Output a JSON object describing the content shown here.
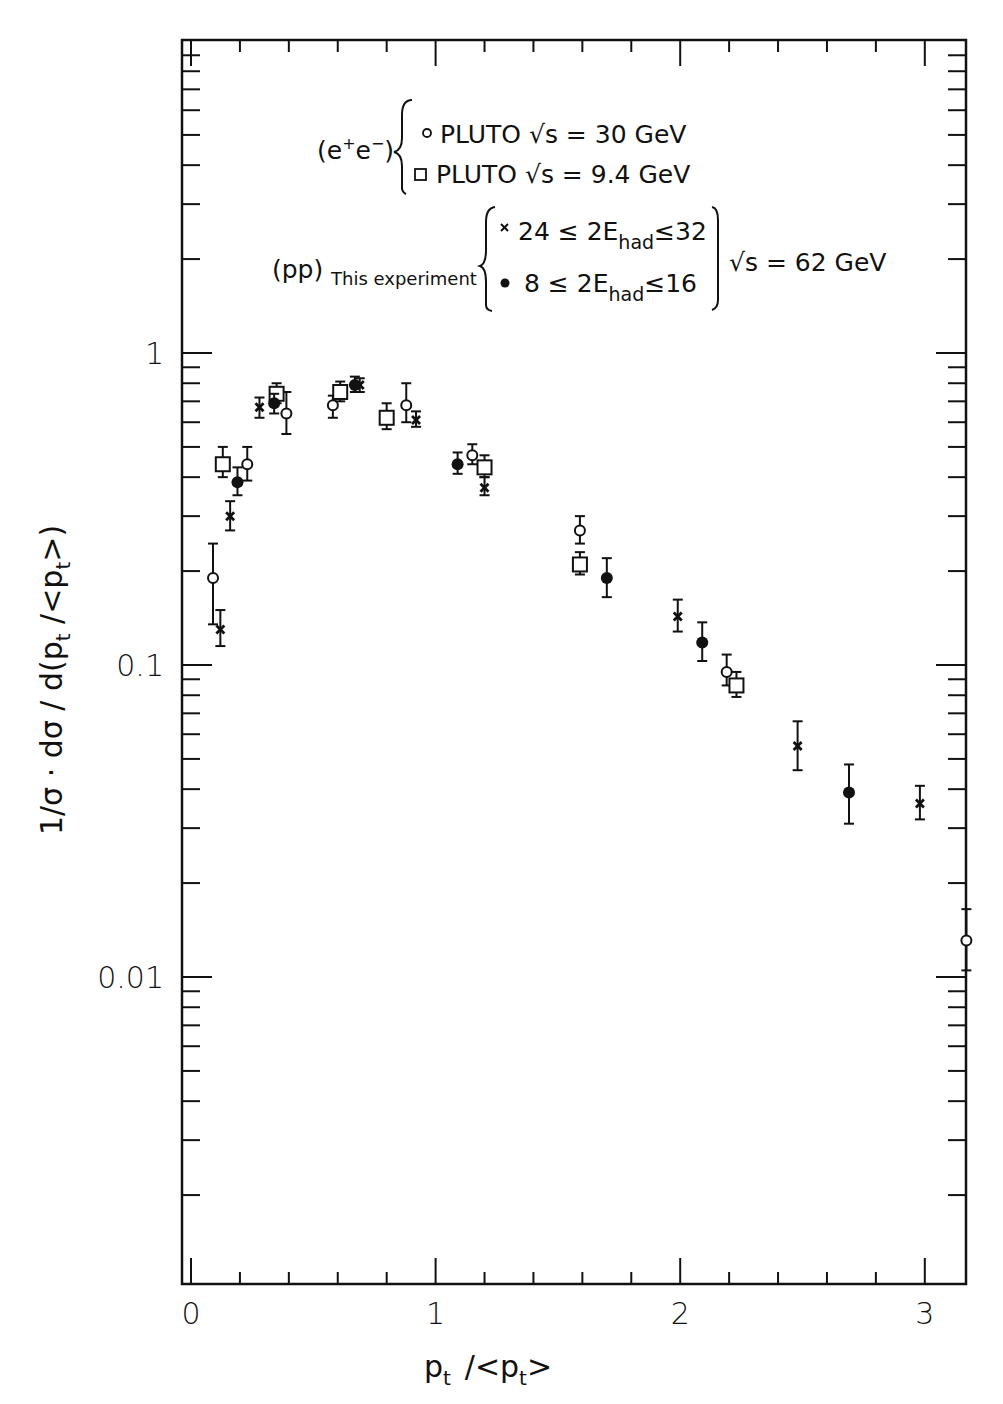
{
  "chart_data": {
    "type": "scatter",
    "title": "",
    "xlabel": "p_t /<p_t>",
    "ylabel": "1/σ · dσ / d(p_t /<p_t>)",
    "xscale": "linear",
    "yscale": "log",
    "xlim": [
      0,
      3.25
    ],
    "ylim": [
      0.001,
      10
    ],
    "x_ticks": [
      0,
      1,
      2,
      3
    ],
    "x_tick_labels": [
      "0",
      "1",
      "2",
      "3"
    ],
    "x_minor_step": 0.2,
    "y_ticks": [
      0.01,
      0.1,
      1
    ],
    "y_tick_labels": [
      "0.01",
      "0.1",
      "1"
    ],
    "grid": false,
    "legend_position": "top-center inside plot",
    "legend": {
      "groups": [
        {
          "label": "(e⁺e⁻)",
          "entries": [
            {
              "marker": "open-circle",
              "text": "PLUTO √s = 30 GeV"
            },
            {
              "marker": "open-square",
              "text": "PLUTO √s = 9.4 GeV"
            }
          ]
        },
        {
          "label": "(pp)",
          "label_sub": "This experiment",
          "entries": [
            {
              "marker": "cross",
              "text": "24 ≤ 2E",
              "sub": "had",
              "tail": "≤32"
            },
            {
              "marker": "filled-circle",
              "text": "8 ≤ 2E",
              "sub": "had",
              "tail": "≤16"
            }
          ],
          "common_note": "√s = 62 GeV"
        }
      ]
    },
    "series": [
      {
        "name": "PLUTO √s = 30 GeV (e+e-)",
        "marker": "open-circle",
        "points": [
          {
            "x": 0.09,
            "y": 0.19,
            "lo": 0.135,
            "hi": 0.245
          },
          {
            "x": 0.23,
            "y": 0.44,
            "lo": 0.39,
            "hi": 0.5
          },
          {
            "x": 0.39,
            "y": 0.64,
            "lo": 0.55,
            "hi": 0.75
          },
          {
            "x": 0.58,
            "y": 0.68,
            "lo": 0.62,
            "hi": 0.73
          },
          {
            "x": 0.88,
            "y": 0.68,
            "lo": 0.6,
            "hi": 0.8
          },
          {
            "x": 1.15,
            "y": 0.47,
            "lo": 0.44,
            "hi": 0.51
          },
          {
            "x": 1.59,
            "y": 0.27,
            "lo": 0.245,
            "hi": 0.3
          },
          {
            "x": 2.19,
            "y": 0.095,
            "lo": 0.086,
            "hi": 0.108
          },
          {
            "x": 3.17,
            "y": 0.0131,
            "lo": 0.0105,
            "hi": 0.0165
          }
        ]
      },
      {
        "name": "PLUTO √s = 9.4 GeV (e+e-)",
        "marker": "open-square",
        "points": [
          {
            "x": 0.13,
            "y": 0.44,
            "lo": 0.4,
            "hi": 0.5
          },
          {
            "x": 0.35,
            "y": 0.74,
            "lo": 0.69,
            "hi": 0.8
          },
          {
            "x": 0.61,
            "y": 0.75,
            "lo": 0.7,
            "hi": 0.81
          },
          {
            "x": 0.8,
            "y": 0.62,
            "lo": 0.57,
            "hi": 0.69
          },
          {
            "x": 1.2,
            "y": 0.43,
            "lo": 0.4,
            "hi": 0.47
          },
          {
            "x": 1.59,
            "y": 0.21,
            "lo": 0.195,
            "hi": 0.23
          },
          {
            "x": 2.23,
            "y": 0.086,
            "lo": 0.079,
            "hi": 0.095
          }
        ]
      },
      {
        "name": "24 ≤ 2E_had ≤ 32 (pp, this experiment, √s = 62 GeV)",
        "marker": "cross",
        "points": [
          {
            "x": 0.12,
            "y": 0.13,
            "lo": 0.115,
            "hi": 0.15
          },
          {
            "x": 0.16,
            "y": 0.3,
            "lo": 0.27,
            "hi": 0.335
          },
          {
            "x": 0.28,
            "y": 0.67,
            "lo": 0.62,
            "hi": 0.72
          },
          {
            "x": 0.69,
            "y": 0.79,
            "lo": 0.75,
            "hi": 0.83
          },
          {
            "x": 0.92,
            "y": 0.61,
            "lo": 0.58,
            "hi": 0.65
          },
          {
            "x": 1.2,
            "y": 0.37,
            "lo": 0.35,
            "hi": 0.4
          },
          {
            "x": 1.99,
            "y": 0.143,
            "lo": 0.128,
            "hi": 0.162
          },
          {
            "x": 2.48,
            "y": 0.055,
            "lo": 0.046,
            "hi": 0.066
          },
          {
            "x": 2.98,
            "y": 0.036,
            "lo": 0.032,
            "hi": 0.041
          }
        ]
      },
      {
        "name": "8 ≤ 2E_had ≤ 16 (pp, this experiment, √s = 62 GeV)",
        "marker": "filled-circle",
        "points": [
          {
            "x": 0.19,
            "y": 0.385,
            "lo": 0.35,
            "hi": 0.43
          },
          {
            "x": 0.34,
            "y": 0.69,
            "lo": 0.64,
            "hi": 0.74
          },
          {
            "x": 0.67,
            "y": 0.79,
            "lo": 0.75,
            "hi": 0.84
          },
          {
            "x": 1.09,
            "y": 0.44,
            "lo": 0.41,
            "hi": 0.48
          },
          {
            "x": 1.7,
            "y": 0.19,
            "lo": 0.165,
            "hi": 0.22
          },
          {
            "x": 2.09,
            "y": 0.118,
            "lo": 0.103,
            "hi": 0.137
          },
          {
            "x": 2.69,
            "y": 0.039,
            "lo": 0.031,
            "hi": 0.048
          }
        ]
      }
    ]
  },
  "colors": {
    "ink": "#111111",
    "background": "#ffffff"
  }
}
